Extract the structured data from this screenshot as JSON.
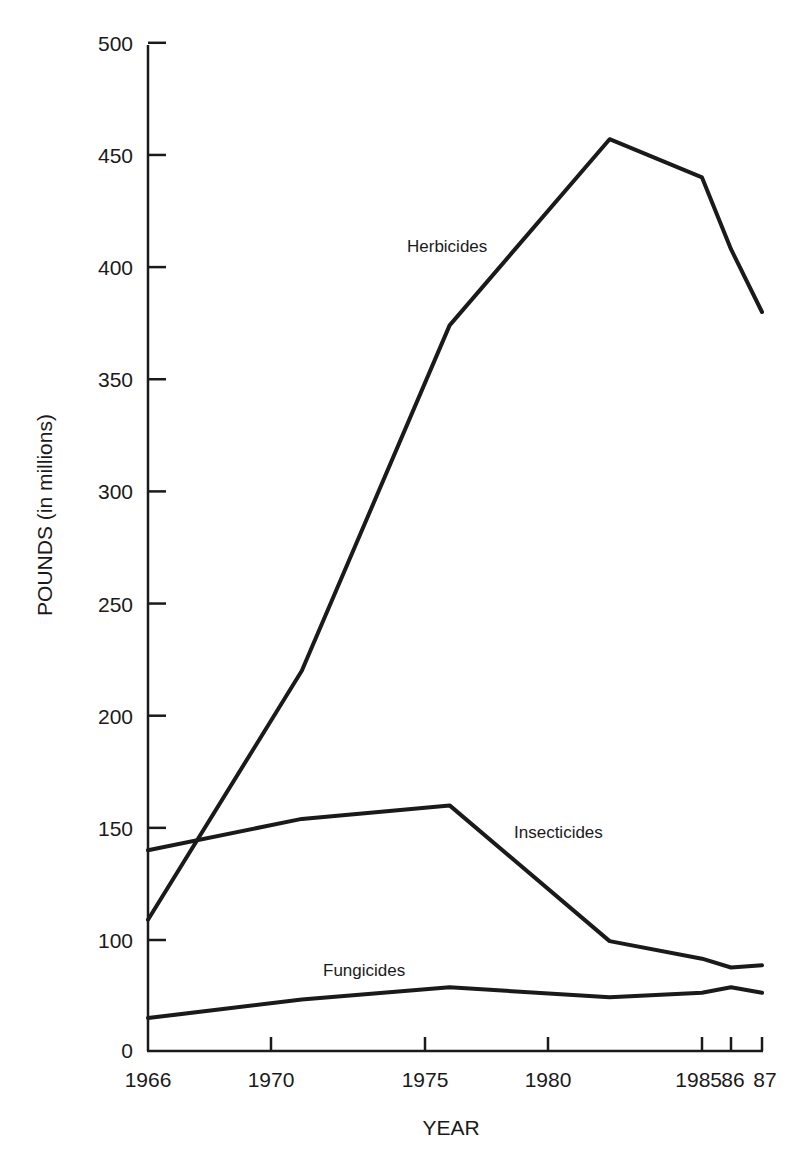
{
  "chart_data": {
    "type": "line",
    "title": "",
    "xlabel": "YEAR",
    "ylabel": "POUNDS (in millions)",
    "ylim": [
      0,
      500
    ],
    "y_axis_break": "axis compressed between 0 and 100",
    "grid": false,
    "legend": "inline labels next to lines",
    "x": [
      1966,
      1971,
      1976,
      1982,
      1985,
      1986,
      1987
    ],
    "x_tick_labels": [
      "1966",
      "1970",
      "1975",
      "1980",
      "1985",
      "86",
      "87"
    ],
    "x_tick_values": [
      1966,
      1970,
      1975,
      1980,
      1985,
      1986,
      1987
    ],
    "y_tick_labels": [
      "0",
      "100",
      "150",
      "200",
      "250",
      "300",
      "350",
      "400",
      "450",
      "500"
    ],
    "y_tick_values": [
      0,
      100,
      150,
      200,
      250,
      300,
      350,
      400,
      450,
      500
    ],
    "series": [
      {
        "name": "Herbicides",
        "values": [
          109,
          220,
          374,
          457,
          440,
          408,
          380
        ]
      },
      {
        "name": "Insecticides",
        "values": [
          140,
          154,
          160,
          99,
          83,
          75,
          77
        ]
      },
      {
        "name": "Fungicides",
        "values": [
          29,
          46,
          57,
          48,
          52,
          57,
          52
        ]
      }
    ]
  },
  "labels": {
    "ylabel": "POUNDS (in millions)",
    "xlabel": "YEAR",
    "herbicides": "Herbicides",
    "insecticides": "Insecticides",
    "fungicides": "Fungicides"
  }
}
